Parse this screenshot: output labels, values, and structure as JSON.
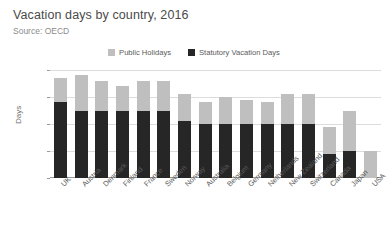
{
  "chart_data": {
    "type": "bar",
    "subtype": "stacked-column",
    "title": "Vacation days by country, 2016",
    "subtitle": "Source: OECD",
    "xlabel": "",
    "ylabel": "Days",
    "ylim": [
      0,
      40
    ],
    "yticks": [
      0,
      10,
      20,
      30,
      40
    ],
    "grid": true,
    "legend_position": "top-center",
    "categories": [
      "UK",
      "Austria",
      "Denmark",
      "Finland",
      "France",
      "Sweden",
      "Norway",
      "Australia",
      "Belgium",
      "Germany",
      "Netherlands",
      "New Zealand",
      "Switzerland",
      "Canada",
      "Japan",
      "USA"
    ],
    "series": [
      {
        "name": "Statutory Vacation Days",
        "color": "#262626",
        "values": [
          28,
          25,
          25,
          25,
          25,
          25,
          21,
          20,
          20,
          20,
          20,
          20,
          20,
          9,
          10,
          0
        ]
      },
      {
        "name": "Public Holidays",
        "color": "#bfbfbf",
        "values": [
          9,
          13,
          11,
          9,
          11,
          11,
          10,
          8,
          10,
          9,
          8,
          11,
          11,
          10,
          15,
          10
        ]
      }
    ],
    "totals": [
      37,
      38,
      36,
      34,
      36,
      36,
      31,
      28,
      30,
      29,
      28,
      31,
      31,
      19,
      25,
      10
    ]
  },
  "legend": {
    "items": [
      {
        "label": "Public Holidays",
        "color": "#bfbfbf"
      },
      {
        "label": "Statutory Vacation Days",
        "color": "#262626"
      }
    ]
  }
}
